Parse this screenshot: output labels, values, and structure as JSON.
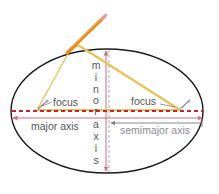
{
  "diagram": {
    "type": "ellipse-construction",
    "labels": {
      "focus_left": "focus",
      "focus_right": "focus",
      "major_axis": "major axis",
      "semimajor_axis": "semimajor axis",
      "minor_axis_letters": [
        "m",
        "i",
        "n",
        "o",
        "r",
        "a",
        "x",
        "i",
        "s"
      ]
    },
    "colors": {
      "ellipse": "#1a1a1a",
      "major_axis_dashed": "#c8202c",
      "axis_arrows": "#d36b86",
      "minor_dashed": "#9a9a9a",
      "semimajor_arrow": "#8a8a9a",
      "string": "#e8c25a",
      "pencil": "#e58a1f",
      "label_text": "#555555",
      "semimajor_text": "#8a8a9a"
    }
  }
}
